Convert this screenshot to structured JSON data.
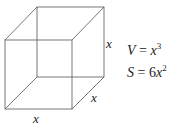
{
  "diagram": {
    "type": "cube",
    "edge_labels": {
      "height": "x",
      "depth": "x",
      "width": "x"
    },
    "formulas": [
      {
        "lhs": "V",
        "eq": " = ",
        "coef": "",
        "var": "x",
        "exp": "3"
      },
      {
        "lhs": "S",
        "eq": " = ",
        "coef": "6",
        "var": "x",
        "exp": "2"
      }
    ],
    "colors": {
      "line": "#555555",
      "text": "#222222"
    }
  }
}
